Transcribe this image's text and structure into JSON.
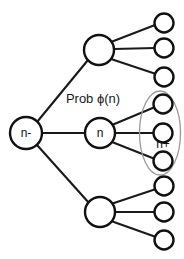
{
  "diagram": {
    "type": "tree-diagram",
    "background_color": "#ffffff",
    "stroke_color": "#111111",
    "ellipse_color": "#9a9a9a",
    "annotation": {
      "prob_label": "Prob ϕ(n)"
    },
    "nodes": {
      "root": {
        "label": "n-",
        "cx": 26,
        "cy": 133,
        "r": 16
      },
      "branch_top": {
        "label": "",
        "cx": 99,
        "cy": 50,
        "r": 15
      },
      "branch_middle": {
        "label": "n",
        "cx": 100,
        "cy": 133,
        "r": 15
      },
      "branch_bottom": {
        "label": "",
        "cx": 100,
        "cy": 212,
        "r": 15
      }
    },
    "leaves": [
      {
        "id": "leaf-top-1",
        "cx": 164,
        "cy": 23,
        "r": 9.5,
        "group": "top"
      },
      {
        "id": "leaf-top-2",
        "cx": 164,
        "cy": 48,
        "r": 9.5,
        "group": "top"
      },
      {
        "id": "leaf-top-3",
        "cx": 164,
        "cy": 77,
        "r": 9.5,
        "group": "top"
      },
      {
        "id": "leaf-mid-1",
        "cx": 163,
        "cy": 104,
        "r": 9.5,
        "group": "middle"
      },
      {
        "id": "leaf-mid-2",
        "cx": 163,
        "cy": 133,
        "r": 9.5,
        "group": "middle"
      },
      {
        "id": "leaf-mid-3",
        "cx": 163,
        "cy": 161,
        "r": 9.5,
        "group": "middle"
      },
      {
        "id": "leaf-bot-1",
        "cx": 164,
        "cy": 186,
        "r": 9.5,
        "group": "bottom"
      },
      {
        "id": "leaf-bot-2",
        "cx": 164,
        "cy": 212,
        "r": 9.5,
        "group": "bottom"
      },
      {
        "id": "leaf-bot-3",
        "cx": 164,
        "cy": 240,
        "r": 9.5,
        "group": "bottom"
      }
    ],
    "group_marker": {
      "label": "n+",
      "cx": 160,
      "cy": 133,
      "rx": 20,
      "ry": 42,
      "label_x": 163,
      "label_y": 145
    }
  }
}
